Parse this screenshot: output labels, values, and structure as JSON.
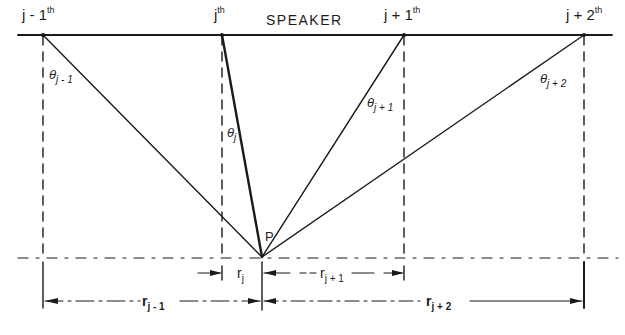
{
  "diagram": {
    "title": "SPEAKER",
    "speakers": [
      {
        "id": "j-1",
        "label_main": "j - 1",
        "label_sup": "th",
        "x": 43
      },
      {
        "id": "j",
        "label_main": "j",
        "label_sup": "th",
        "x": 222
      },
      {
        "id": "j+1",
        "label_main": "j + 1",
        "label_sup": "th",
        "x": 404
      },
      {
        "id": "j+2",
        "label_main": "j + 2",
        "label_sup": "th",
        "x": 584
      }
    ],
    "listener_point": {
      "label": "P",
      "x": 262,
      "y": 257
    },
    "angles": [
      {
        "symbol": "θ",
        "subscript": "j - 1"
      },
      {
        "symbol": "θ",
        "subscript": "j"
      },
      {
        "symbol": "θ",
        "subscript": "j + 1"
      },
      {
        "symbol": "θ",
        "subscript": "j + 2"
      }
    ],
    "distances": [
      {
        "symbol": "r",
        "subscript": "j - 1"
      },
      {
        "symbol": "r",
        "subscript": "j"
      },
      {
        "symbol": "r",
        "subscript": "j + 1"
      },
      {
        "symbol": "r",
        "subscript": "j + 2"
      }
    ],
    "colors": {
      "ink": "#1a1a1a",
      "background": "#ffffff"
    }
  }
}
